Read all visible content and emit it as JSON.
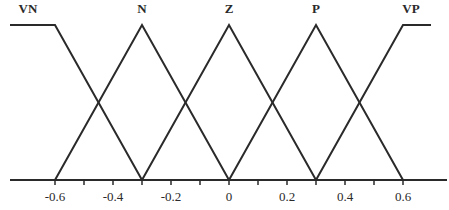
{
  "chart_data": {
    "type": "line",
    "title": "",
    "xlabel": "",
    "ylabel": "",
    "xlim": [
      -0.75,
      0.75
    ],
    "ylim": [
      0,
      1
    ],
    "grid": false,
    "legend": "none",
    "x_ticks": [
      -0.6,
      -0.5,
      -0.4,
      -0.3,
      -0.2,
      -0.1,
      0,
      0.1,
      0.2,
      0.3,
      0.4,
      0.5,
      0.6
    ],
    "x_tick_labels": [
      "-0.6",
      "-0.4",
      "-0.2",
      "0",
      "0.2",
      "0.4",
      "0.6"
    ],
    "x_tick_label_values": [
      -0.6,
      -0.4,
      -0.2,
      0,
      0.2,
      0.4,
      0.6
    ],
    "series": [
      {
        "name": "VN",
        "x": [
          -0.75,
          -0.6,
          -0.3
        ],
        "values": [
          1,
          1,
          0
        ]
      },
      {
        "name": "N",
        "x": [
          -0.6,
          -0.3,
          0
        ],
        "values": [
          0,
          1,
          0
        ]
      },
      {
        "name": "Z",
        "x": [
          -0.3,
          0,
          0.3
        ],
        "values": [
          0,
          1,
          0
        ]
      },
      {
        "name": "P",
        "x": [
          0,
          0.3,
          0.6
        ],
        "values": [
          0,
          1,
          0
        ]
      },
      {
        "name": "VP",
        "x": [
          0.3,
          0.6,
          0.7
        ],
        "values": [
          0,
          1,
          1
        ]
      }
    ]
  },
  "colors": {
    "line": "#2a2a2a",
    "background": "#ffffff"
  }
}
